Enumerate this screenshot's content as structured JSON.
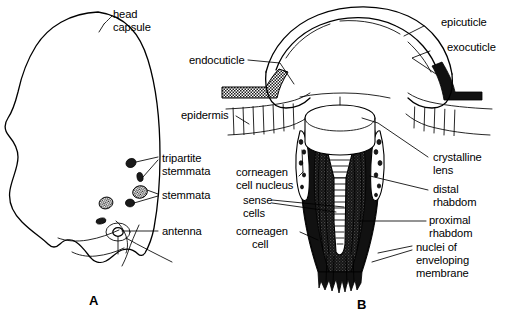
{
  "figure": {
    "background_color": "#ffffff",
    "ink_color": "#000000",
    "panels": [
      {
        "id": "A",
        "letter": "A",
        "caption": "A",
        "description": "Lateral view of larval head capsule showing stemmata and antenna"
      },
      {
        "id": "B",
        "letter": "B",
        "caption": "B",
        "description": "Longitudinal section through a single stemma"
      }
    ]
  },
  "panel_a": {
    "letter": "A",
    "labels": [
      {
        "key": "head_capsule",
        "lines": [
          "head",
          "capsule"
        ],
        "x": 108,
        "y": 15
      },
      {
        "key": "tripartite_stemmata",
        "lines": [
          "tripartite",
          "stemmata"
        ],
        "x": 160,
        "y": 158
      },
      {
        "key": "stemmata",
        "lines": [
          "stemmata"
        ],
        "x": 160,
        "y": 195
      },
      {
        "key": "antenna",
        "lines": [
          "antenna"
        ],
        "x": 160,
        "y": 232
      }
    ],
    "structures": [
      {
        "name": "head-capsule-outline",
        "type": "outline"
      },
      {
        "name": "stemma-spot",
        "count": 6,
        "type": "dark-oval"
      },
      {
        "name": "antenna-socket",
        "type": "ring"
      }
    ]
  },
  "panel_b": {
    "letter": "B",
    "labels": [
      {
        "key": "epicuticle",
        "lines": [
          "epicuticle"
        ],
        "x": 440,
        "y": 22,
        "side": "right"
      },
      {
        "key": "exocuticle",
        "lines": [
          "exocuticle"
        ],
        "x": 446,
        "y": 48,
        "side": "right"
      },
      {
        "key": "endocuticle",
        "lines": [
          "endocuticle"
        ],
        "x": 189,
        "y": 61,
        "side": "left"
      },
      {
        "key": "epidermis",
        "lines": [
          "epidermis"
        ],
        "x": 181,
        "y": 113,
        "side": "left"
      },
      {
        "key": "corneagen_cell_nucleus",
        "lines": [
          "corneagen",
          "cell nucleus"
        ],
        "x": 236,
        "y": 172,
        "side": "left"
      },
      {
        "key": "sense_cells",
        "lines": [
          "sense",
          "cells"
        ],
        "x": 241,
        "y": 201,
        "side": "left"
      },
      {
        "key": "corneagen_cell",
        "lines": [
          "corneagen",
          "cell"
        ],
        "x": 236,
        "y": 231,
        "side": "left"
      },
      {
        "key": "crystalline_lens",
        "lines": [
          "crystalline",
          "lens"
        ],
        "x": 432,
        "y": 158,
        "side": "right"
      },
      {
        "key": "distal_rhabdom",
        "lines": [
          "distal",
          "rhabdom"
        ],
        "x": 432,
        "y": 189,
        "side": "right"
      },
      {
        "key": "proximal_rhabdom",
        "lines": [
          "proximal",
          "rhabdom"
        ],
        "x": 428,
        "y": 219,
        "side": "right"
      },
      {
        "key": "nuclei_of_enveloping_membrane",
        "lines": [
          "nuclei of",
          "enveloping",
          "membrane"
        ],
        "x": 415,
        "y": 248,
        "side": "right"
      }
    ],
    "structures": [
      {
        "name": "cuticle-dome",
        "type": "outline"
      },
      {
        "name": "epicuticle-line",
        "type": "dashed-arc"
      },
      {
        "name": "exocuticle-patch",
        "type": "solid-dark"
      },
      {
        "name": "endocuticle-patch",
        "type": "stipple"
      },
      {
        "name": "epidermis-layer",
        "type": "hatched-band"
      },
      {
        "name": "crystalline-lens",
        "type": "white-cylinder"
      },
      {
        "name": "corneagen-cell",
        "type": "dark-cell"
      },
      {
        "name": "distal-rhabdom",
        "type": "hatched-cone"
      },
      {
        "name": "proximal-rhabdom",
        "type": "hatched-column"
      },
      {
        "name": "sense-cell-bundle",
        "type": "dark-cell"
      },
      {
        "name": "enveloping-membrane",
        "type": "dark-fringe"
      }
    ]
  }
}
